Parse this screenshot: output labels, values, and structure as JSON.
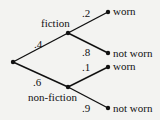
{
  "diagram": {
    "type": "probability-tree",
    "root": {
      "x": 13,
      "y": 62
    },
    "level1": [
      {
        "label": "fiction",
        "prob": ".4",
        "x": 68,
        "y": 33,
        "children": [
          {
            "label": "worn",
            "prob": ".2",
            "x": 108,
            "y": 12
          },
          {
            "label": "not worn",
            "prob": ".8",
            "x": 108,
            "y": 53
          }
        ]
      },
      {
        "label": "non-fiction",
        "prob": ".6",
        "x": 68,
        "y": 87,
        "children": [
          {
            "label": "worn",
            "prob": ".1",
            "x": 108,
            "y": 67
          },
          {
            "label": "not worn",
            "prob": ".9",
            "x": 108,
            "y": 108
          }
        ]
      }
    ]
  }
}
